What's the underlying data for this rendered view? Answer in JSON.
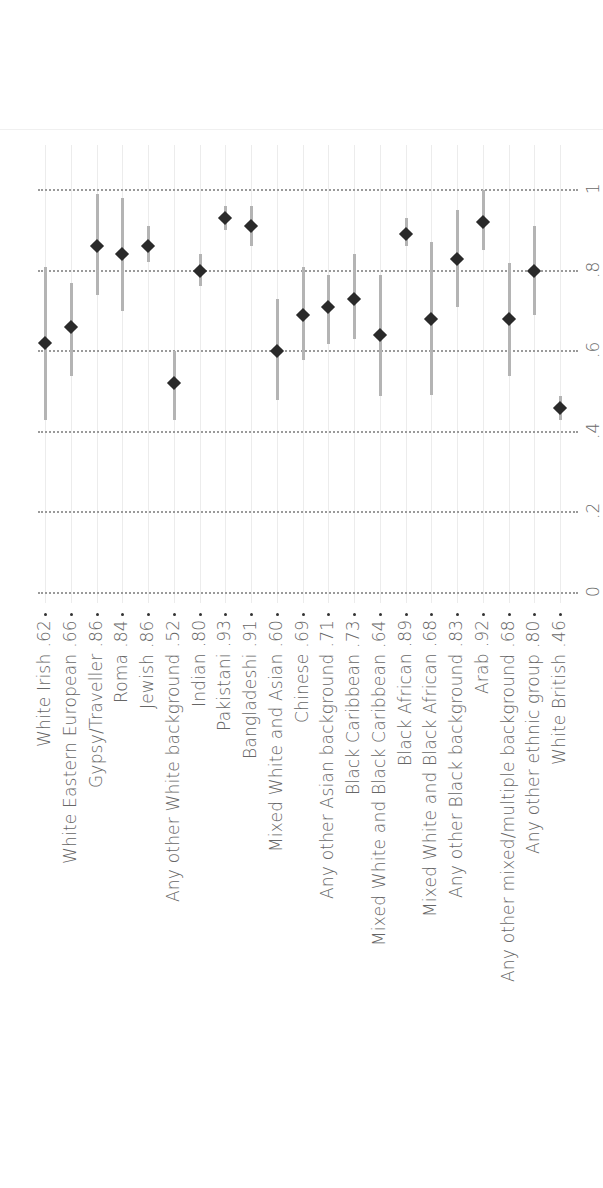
{
  "chart_data": {
    "type": "scatter",
    "orientation": "rotated-90-ccw (horizontal dot plot with error bars)",
    "title": "",
    "xlabel": "",
    "ylabel": "",
    "axis_range": [
      0,
      1
    ],
    "axis_ticks": [
      {
        "value": 0,
        "label": "0"
      },
      {
        "value": 0.2,
        "label": ".2"
      },
      {
        "value": 0.4,
        "label": ".4"
      },
      {
        "value": 0.6,
        "label": ".6"
      },
      {
        "value": 0.8,
        "label": ".8"
      },
      {
        "value": 1,
        "label": "1"
      }
    ],
    "grid": "dotted",
    "legend": null,
    "categories": [
      "White Irish",
      "White Eastern European",
      "Gypsy/Traveller",
      "Roma",
      "Jewish",
      "Any other White background",
      "Indian",
      "Pakistani",
      "Bangladeshi",
      "Mixed White and Asian",
      "Chinese",
      "Any other Asian background",
      "Black Caribbean",
      "Mixed White and Black Caribbean",
      "Black African",
      "Mixed White and Black African",
      "Any other Black background",
      "Arab",
      "Any other mixed/multiple background",
      "Any other ethnic group",
      "White British"
    ],
    "value_labels": [
      ".62",
      ".66",
      ".86",
      ".84",
      ".86",
      ".52",
      ".80",
      ".93",
      ".91",
      ".60",
      ".69",
      ".71",
      ".73",
      ".64",
      ".89",
      ".68",
      ".83",
      ".92",
      ".68",
      ".80",
      ".46"
    ],
    "series": [
      {
        "name": "estimate",
        "values": [
          0.62,
          0.66,
          0.86,
          0.84,
          0.86,
          0.52,
          0.8,
          0.93,
          0.91,
          0.6,
          0.69,
          0.71,
          0.73,
          0.64,
          0.89,
          0.68,
          0.83,
          0.92,
          0.68,
          0.8,
          0.46
        ]
      },
      {
        "name": "ci_low",
        "values": [
          0.43,
          0.54,
          0.74,
          0.7,
          0.82,
          0.43,
          0.76,
          0.9,
          0.86,
          0.48,
          0.58,
          0.62,
          0.63,
          0.49,
          0.86,
          0.49,
          0.71,
          0.85,
          0.54,
          0.69,
          0.43
        ]
      },
      {
        "name": "ci_high",
        "values": [
          0.81,
          0.77,
          0.99,
          0.98,
          0.91,
          0.6,
          0.84,
          0.96,
          0.96,
          0.73,
          0.81,
          0.79,
          0.84,
          0.79,
          0.93,
          0.87,
          0.95,
          1.0,
          0.82,
          0.91,
          0.49
        ]
      }
    ]
  },
  "colors": {
    "marker": "#2a2a2a",
    "ci_bar": "#b4b4b4",
    "grid_dots": "#9a9a9a",
    "column_line": "#ececec",
    "label_text": "#666666"
  }
}
